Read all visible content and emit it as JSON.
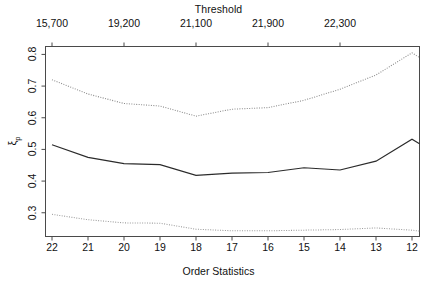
{
  "chart_data": {
    "type": "line",
    "title": "Threshold",
    "xlabel": "Order Statistics",
    "ylabel": "ξ_p",
    "ylabel_base": "ξ",
    "ylabel_sub": "p",
    "x": [
      22,
      21,
      20,
      19,
      18,
      17,
      16,
      15,
      14,
      13,
      12
    ],
    "categories": [
      "22",
      "21",
      "20",
      "19",
      "18",
      "17",
      "16",
      "15",
      "14",
      "13",
      "12"
    ],
    "xlim": [
      22,
      12
    ],
    "ylim": [
      0.225,
      0.825
    ],
    "yticks": [
      0.3,
      0.4,
      0.5,
      0.6,
      0.7,
      0.8
    ],
    "ytick_labels": [
      "0.3",
      "0.4",
      "0.5",
      "0.6",
      "0.7",
      "0.8"
    ],
    "grid": false,
    "legend": null,
    "top_axis": {
      "title": "Threshold",
      "tick_x": [
        22,
        20,
        18,
        16,
        14
      ],
      "tick_labels": [
        "15,700",
        "19,200",
        "21,100",
        "21,900",
        "22,300"
      ]
    },
    "series": [
      {
        "name": "upper-confidence-bound",
        "style": "dotted",
        "color": "#8a8a8a",
        "values": [
          0.72,
          0.675,
          0.645,
          0.637,
          0.605,
          0.627,
          0.632,
          0.655,
          0.69,
          0.735,
          0.805
        ]
      },
      {
        "name": "estimate",
        "style": "solid",
        "color": "#2b2b2b",
        "values": [
          0.515,
          0.475,
          0.455,
          0.452,
          0.418,
          0.425,
          0.427,
          0.442,
          0.435,
          0.463,
          0.532
        ]
      },
      {
        "name": "lower-confidence-bound",
        "style": "dotted",
        "color": "#9a9a9a",
        "values": [
          0.295,
          0.278,
          0.268,
          0.267,
          0.248,
          0.243,
          0.243,
          0.245,
          0.247,
          0.252,
          0.245
        ]
      }
    ],
    "series_right_tail": {
      "upper-confidence-bound": 0.79,
      "estimate": 0.518,
      "lower-confidence-bound": 0.242
    }
  },
  "axes": {
    "frame_color": "#4a4a4a"
  }
}
